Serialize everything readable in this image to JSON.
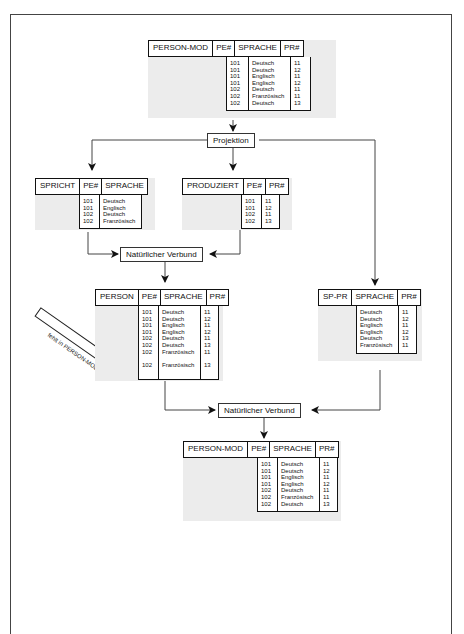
{
  "diagram": {
    "operators": {
      "projection": "Projektion",
      "join1": "Natürlicher Verbund",
      "join2": "Natürlicher Verbund"
    },
    "annotation": "fehlt in PERSON-MOD",
    "tables": {
      "person_mod_top": {
        "name": "PERSON-MOD",
        "columns": [
          "PE#",
          "SPRACHE",
          "PR#"
        ],
        "cols": {
          "pe": "101\n101\n101\n101\n102\n102\n102",
          "sprache": "Deutsch\nDeutsch\nEnglisch\nEnglisch\nDeutsch\nFranzösisch\nDeutsch",
          "pr": "11\n12\n11\n12\n11\n11\n13"
        }
      },
      "spricht": {
        "name": "SPRICHT",
        "columns": [
          "PE#",
          "SPRACHE"
        ],
        "cols": {
          "pe": "101\n101\n102\n102",
          "sprache": "Deutsch\nEnglisch\nDeutsch\nFranzösisch"
        }
      },
      "produziert": {
        "name": "PRODUZIERT",
        "columns": [
          "PE#",
          "PR#"
        ],
        "cols": {
          "pe": "101\n101\n102\n102",
          "pr": "11\n12\n11\n13"
        }
      },
      "person": {
        "name": "PERSON",
        "columns": [
          "PE#",
          "SPRACHE",
          "PR#"
        ],
        "cols": {
          "pe": "101\n101\n101\n101\n102\n102\n102\n\n102",
          "sprache": "Deutsch\nDeutsch\nEnglisch\nEnglisch\nDeutsch\nDeutsch\nFranzösisch\n\nFranzösisch",
          "pr": "11\n12\n11\n12\n11\n13\n11\n\n13"
        }
      },
      "sp_pr": {
        "name": "SP-PR",
        "columns": [
          "SPRACHE",
          "PR#"
        ],
        "cols": {
          "sprache": "Deutsch\nDeutsch\nEnglisch\nEnglisch\nDeutsch\nFranzösisch",
          "pr": "11\n12\n11\n12\n13\n11"
        }
      },
      "person_mod_bottom": {
        "name": "PERSON-MOD",
        "columns": [
          "PE#",
          "SPRACHE",
          "PR#"
        ],
        "cols": {
          "pe": "101\n101\n101\n101\n102\n102\n102",
          "sprache": "Deutsch\nDeutsch\nEnglisch\nEnglisch\nDeutsch\nFranzösisch\nDeutsch",
          "pr": "11\n12\n11\n12\n11\n11\n13"
        }
      }
    }
  }
}
